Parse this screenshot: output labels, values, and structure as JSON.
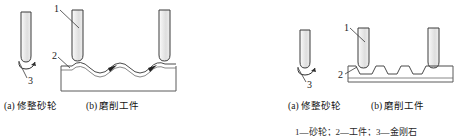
{
  "figure": {
    "background_color": "#ffffff",
    "line_color": "#3a3a3a",
    "wheel_fill": "#e9e9e9",
    "text_color": "#1a1a1a"
  },
  "left_figure": {
    "subfigures": [
      {
        "caption": "(a) 修整砂轮"
      },
      {
        "caption": "(b) 磨削工件"
      }
    ],
    "callouts": [
      {
        "id": "1",
        "label": "1"
      },
      {
        "id": "2",
        "label": "2"
      },
      {
        "id": "3",
        "label": "3"
      }
    ],
    "workpiece_profile": "wavy"
  },
  "right_figure": {
    "subfigures": [
      {
        "caption": "(a) 修整砂轮"
      },
      {
        "caption": "(b) 磨削工件"
      }
    ],
    "callouts": [
      {
        "id": "1",
        "label": "1"
      },
      {
        "id": "2",
        "label": "2"
      },
      {
        "id": "3",
        "label": "3"
      }
    ],
    "workpiece_profile": "grooved"
  },
  "legend": {
    "text": "1—砂轮；2—工件；3—金刚石"
  }
}
